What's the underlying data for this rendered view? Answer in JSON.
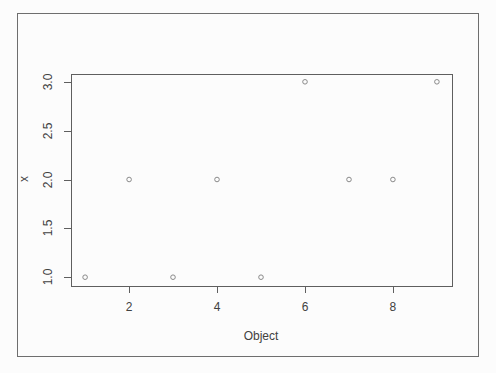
{
  "chart_data": {
    "type": "scatter",
    "title": "",
    "xlabel": "Object",
    "ylabel": "x",
    "x": [
      1,
      2,
      3,
      4,
      5,
      6,
      7,
      8,
      9
    ],
    "y": [
      1,
      2,
      1,
      2,
      1,
      3,
      2,
      2,
      3
    ],
    "x_tick_labels": [
      "2",
      "4",
      "6",
      "8"
    ],
    "x_tick_values": [
      2,
      4,
      6,
      8
    ],
    "y_tick_labels": [
      "1.0",
      "1.5",
      "2.0",
      "2.5",
      "3.0"
    ],
    "y_tick_values": [
      1.0,
      1.5,
      2.0,
      2.5,
      3.0
    ],
    "xlim": [
      0.68,
      9.32
    ],
    "ylim": [
      0.92,
      3.08
    ],
    "grid": false,
    "legend": null,
    "marker": "open-circle",
    "marker_color": "#8a8a8a",
    "axis_color": "#5f5f5f",
    "frame_color": "#6e6e6e",
    "text_color": "#414141"
  }
}
